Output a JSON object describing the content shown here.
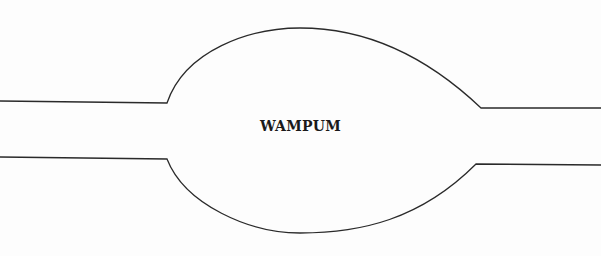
{
  "diagram": {
    "label": "WAMPUM",
    "stroke_color": "#2a2a2a",
    "background": "#fdfdfd"
  }
}
